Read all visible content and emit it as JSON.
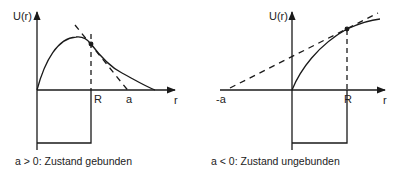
{
  "left": {
    "y_axis_label": "U(r)",
    "x_axis_label": "r",
    "tick_R": "R",
    "tick_a": "a",
    "caption": "a > 0: Zustand gebunden"
  },
  "right": {
    "y_axis_label": "U(r)",
    "x_axis_label": "r",
    "tick_R": "R",
    "tick_neg_a": "-a",
    "caption": "a < 0: Zustand ungebunden"
  },
  "colors": {
    "line": "#1a1a1a",
    "background": "#ffffff"
  }
}
